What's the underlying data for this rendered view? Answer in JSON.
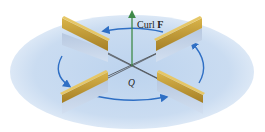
{
  "figure": {
    "labels": {
      "curl_prefix": "Curl ",
      "curl_vector": "F",
      "point": "Q"
    },
    "colors": {
      "disk_fill": "#c9dcf1",
      "rotation_arrows": "#2f6fc4",
      "curl_arrow": "#3f8a4a",
      "paddle_top": "#c9a43c",
      "paddle_face": "#b08a2e",
      "paddle_shadow": "#a9bdd8",
      "axis_lines": "#333333"
    },
    "paddles": [
      "upper-left",
      "upper-right",
      "lower-left",
      "lower-right"
    ],
    "rotation_direction": "counterclockwise"
  }
}
